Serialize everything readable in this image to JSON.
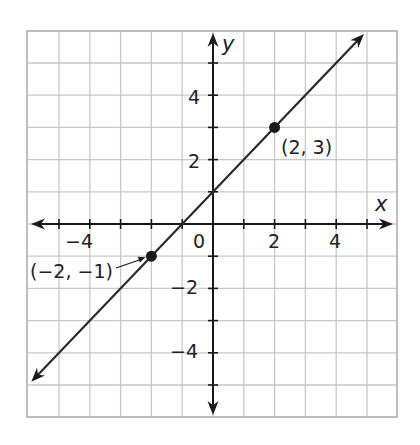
{
  "chart_data": {
    "type": "line",
    "title": "",
    "xlabel": "x",
    "ylabel": "y",
    "xlim": [
      -6,
      6
    ],
    "ylim": [
      -6,
      6
    ],
    "grid": true,
    "x_ticks": [
      -6,
      -5,
      -4,
      -3,
      -2,
      -1,
      0,
      1,
      2,
      3,
      4,
      5
    ],
    "x_tick_labels": [
      {
        "value": -4,
        "text": "−4"
      },
      {
        "value": 2,
        "text": "2"
      },
      {
        "value": 4,
        "text": "4"
      }
    ],
    "y_tick_labels": [
      {
        "value": 4,
        "text": "4"
      },
      {
        "value": 2,
        "text": "2"
      },
      {
        "value": -2,
        "text": "−2"
      },
      {
        "value": -4,
        "text": "−4"
      }
    ],
    "origin_label": "0",
    "series": [
      {
        "name": "y = x + 1",
        "equation": "y = x + 1",
        "endpoints": [
          [
            -5.9,
            -4.9
          ],
          [
            4.9,
            5.9
          ]
        ],
        "arrows_both_ends": true
      }
    ],
    "points": [
      {
        "x": 2,
        "y": 3,
        "label": "(2, 3)"
      },
      {
        "x": -2,
        "y": -1,
        "label": "(−2, −1)"
      }
    ]
  },
  "colors": {
    "grid": "#c8c8c8",
    "border": "#bdbdbd",
    "axis": "#1a1a1a",
    "line": "#2a2a2a",
    "point": "#1a1a1a"
  }
}
